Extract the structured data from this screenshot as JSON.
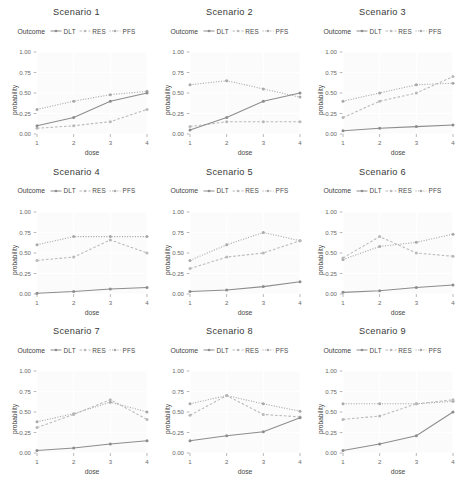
{
  "figure": {
    "n_panels": 9,
    "legend_title": "Outcome",
    "xlabel": "dose",
    "ylabel": "probability"
  },
  "legend": {
    "title": "Outcome",
    "entries": [
      {
        "label": "DLT",
        "color": "#8d8d8d",
        "dash": "solid"
      },
      {
        "label": "RES",
        "color": "#b9b9b9",
        "dash": "dashed"
      },
      {
        "label": "PFS",
        "color": "#a8a8a8",
        "dash": "dotted"
      }
    ]
  },
  "axes": {
    "x_ticks": [
      "1",
      "2",
      "3",
      "4"
    ],
    "y_ticks": [
      "0.00",
      "0.25",
      "0.50",
      "0.75",
      "1.00"
    ],
    "xlim": [
      1,
      4
    ],
    "ylim": [
      0,
      1
    ]
  },
  "colors": {
    "panel_bg": "#fbfbfb",
    "gridline": "#ffffff",
    "dlt": "#8d8d8d",
    "res": "#b9b9b9",
    "pfs": "#a8a8a8",
    "text": "#4a4a4a"
  },
  "chart_data": [
    {
      "type": "line",
      "title": "Scenario 1",
      "xlabel": "dose",
      "ylabel": "probability",
      "x": [
        1,
        2,
        3,
        4
      ],
      "xlim": [
        1,
        4
      ],
      "ylim": [
        0,
        1
      ],
      "grid": true,
      "legend_position": "top",
      "series": [
        {
          "name": "DLT",
          "values": [
            0.1,
            0.2,
            0.4,
            0.5
          ]
        },
        {
          "name": "RES",
          "values": [
            0.07,
            0.1,
            0.15,
            0.3
          ]
        },
        {
          "name": "PFS",
          "values": [
            0.3,
            0.4,
            0.48,
            0.52
          ]
        }
      ]
    },
    {
      "type": "line",
      "title": "Scenario 2",
      "xlabel": "dose",
      "ylabel": "probability",
      "x": [
        1,
        2,
        3,
        4
      ],
      "xlim": [
        1,
        4
      ],
      "ylim": [
        0,
        1
      ],
      "grid": true,
      "legend_position": "top",
      "series": [
        {
          "name": "DLT",
          "values": [
            0.05,
            0.2,
            0.4,
            0.5
          ]
        },
        {
          "name": "RES",
          "values": [
            0.09,
            0.15,
            0.15,
            0.15
          ]
        },
        {
          "name": "PFS",
          "values": [
            0.6,
            0.65,
            0.55,
            0.45
          ]
        }
      ]
    },
    {
      "type": "line",
      "title": "Scenario 3",
      "xlabel": "dose",
      "ylabel": "probability",
      "x": [
        1,
        2,
        3,
        4
      ],
      "xlim": [
        1,
        4
      ],
      "ylim": [
        0,
        1
      ],
      "grid": true,
      "legend_position": "top",
      "series": [
        {
          "name": "DLT",
          "values": [
            0.04,
            0.07,
            0.09,
            0.11
          ]
        },
        {
          "name": "RES",
          "values": [
            0.2,
            0.4,
            0.5,
            0.7
          ]
        },
        {
          "name": "PFS",
          "values": [
            0.4,
            0.5,
            0.6,
            0.62
          ]
        }
      ]
    },
    {
      "type": "line",
      "title": "Scenario 4",
      "xlabel": "dose",
      "ylabel": "probability",
      "x": [
        1,
        2,
        3,
        4
      ],
      "xlim": [
        1,
        4
      ],
      "ylim": [
        0,
        1
      ],
      "grid": true,
      "legend_position": "top",
      "series": [
        {
          "name": "DLT",
          "values": [
            0.01,
            0.03,
            0.06,
            0.08
          ]
        },
        {
          "name": "RES",
          "values": [
            0.41,
            0.45,
            0.66,
            0.5
          ]
        },
        {
          "name": "PFS",
          "values": [
            0.6,
            0.7,
            0.7,
            0.7
          ]
        }
      ]
    },
    {
      "type": "line",
      "title": "Scenario 5",
      "xlabel": "dose",
      "ylabel": "probability",
      "x": [
        1,
        2,
        3,
        4
      ],
      "xlim": [
        1,
        4
      ],
      "ylim": [
        0,
        1
      ],
      "grid": true,
      "legend_position": "top",
      "series": [
        {
          "name": "DLT",
          "values": [
            0.03,
            0.05,
            0.09,
            0.15
          ]
        },
        {
          "name": "RES",
          "values": [
            0.31,
            0.45,
            0.5,
            0.65
          ]
        },
        {
          "name": "PFS",
          "values": [
            0.41,
            0.6,
            0.75,
            0.65
          ]
        }
      ]
    },
    {
      "type": "line",
      "title": "Scenario 6",
      "xlabel": "dose",
      "ylabel": "probability",
      "x": [
        1,
        2,
        3,
        4
      ],
      "xlim": [
        1,
        4
      ],
      "ylim": [
        0,
        1
      ],
      "grid": true,
      "legend_position": "top",
      "series": [
        {
          "name": "DLT",
          "values": [
            0.02,
            0.04,
            0.08,
            0.11
          ]
        },
        {
          "name": "RES",
          "values": [
            0.44,
            0.7,
            0.5,
            0.46
          ]
        },
        {
          "name": "PFS",
          "values": [
            0.42,
            0.58,
            0.63,
            0.73
          ]
        }
      ]
    },
    {
      "type": "line",
      "title": "Scenario 7",
      "xlabel": "dose",
      "ylabel": "probability",
      "x": [
        1,
        2,
        3,
        4
      ],
      "xlim": [
        1,
        4
      ],
      "ylim": [
        0,
        1
      ],
      "grid": true,
      "legend_position": "top",
      "series": [
        {
          "name": "DLT",
          "values": [
            0.03,
            0.06,
            0.11,
            0.15
          ]
        },
        {
          "name": "RES",
          "values": [
            0.31,
            0.47,
            0.65,
            0.41
          ]
        },
        {
          "name": "PFS",
          "values": [
            0.38,
            0.48,
            0.62,
            0.5
          ]
        }
      ]
    },
    {
      "type": "line",
      "title": "Scenario 8",
      "xlabel": "dose",
      "ylabel": "probability",
      "x": [
        1,
        2,
        3,
        4
      ],
      "xlim": [
        1,
        4
      ],
      "ylim": [
        0,
        1
      ],
      "grid": true,
      "legend_position": "top",
      "series": [
        {
          "name": "DLT",
          "values": [
            0.15,
            0.21,
            0.26,
            0.43
          ]
        },
        {
          "name": "RES",
          "values": [
            0.46,
            0.7,
            0.47,
            0.44
          ]
        },
        {
          "name": "PFS",
          "values": [
            0.6,
            0.7,
            0.6,
            0.51
          ]
        }
      ]
    },
    {
      "type": "line",
      "title": "Scenario 9",
      "xlabel": "dose",
      "ylabel": "probability",
      "x": [
        1,
        2,
        3,
        4
      ],
      "xlim": [
        1,
        4
      ],
      "ylim": [
        0,
        1
      ],
      "grid": true,
      "legend_position": "top",
      "series": [
        {
          "name": "DLT",
          "values": [
            0.03,
            0.11,
            0.21,
            0.5
          ]
        },
        {
          "name": "RES",
          "values": [
            0.41,
            0.45,
            0.6,
            0.65
          ]
        },
        {
          "name": "PFS",
          "values": [
            0.6,
            0.6,
            0.6,
            0.63
          ]
        }
      ]
    }
  ]
}
